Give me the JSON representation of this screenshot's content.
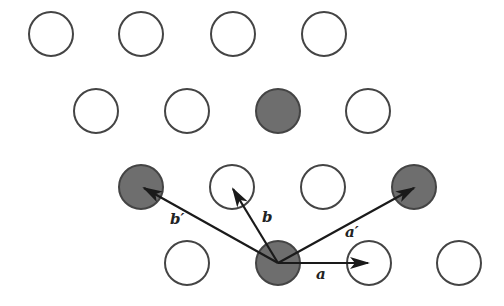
{
  "diagram": {
    "type": "lattice",
    "colors": {
      "stroke": "#444444",
      "filled": "#6e6e6e",
      "empty": "#ffffff",
      "arrow": "#1a1a1a"
    },
    "radius": 22,
    "rows": [
      {
        "y": 34,
        "atoms": [
          {
            "x": 51,
            "filled": false
          },
          {
            "x": 141,
            "filled": false
          },
          {
            "x": 233,
            "filled": false
          },
          {
            "x": 324,
            "filled": false
          }
        ]
      },
      {
        "y": 111,
        "atoms": [
          {
            "x": 96,
            "filled": false
          },
          {
            "x": 187,
            "filled": false
          },
          {
            "x": 278,
            "filled": true
          },
          {
            "x": 368,
            "filled": false
          }
        ]
      },
      {
        "y": 187,
        "atoms": [
          {
            "x": 141,
            "filled": true
          },
          {
            "x": 232,
            "filled": false
          },
          {
            "x": 323,
            "filled": false
          },
          {
            "x": 414,
            "filled": true
          }
        ]
      },
      {
        "y": 263,
        "atoms": [
          {
            "x": 187,
            "filled": false
          },
          {
            "x": 278,
            "filled": true
          },
          {
            "x": 369,
            "filled": false
          },
          {
            "x": 459,
            "filled": false
          }
        ]
      }
    ],
    "origin": {
      "x": 278,
      "y": 263
    },
    "vectors": [
      {
        "name": "a",
        "label": "a",
        "to": {
          "x": 368,
          "y": 263
        },
        "label_pos": {
          "x": 316,
          "y": 267
        }
      },
      {
        "name": "b",
        "label": "b",
        "to": {
          "x": 233,
          "y": 189
        },
        "label_pos": {
          "x": 262,
          "y": 210
        }
      },
      {
        "name": "a-prime",
        "label": "a′",
        "to": {
          "x": 414,
          "y": 188
        },
        "label_pos": {
          "x": 345,
          "y": 225
        }
      },
      {
        "name": "b-prime",
        "label": "b′",
        "to": {
          "x": 144,
          "y": 188
        },
        "label_pos": {
          "x": 170,
          "y": 212
        }
      }
    ]
  }
}
